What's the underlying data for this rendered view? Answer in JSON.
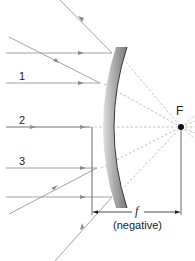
{
  "diagram": {
    "focal_point": {
      "label": "F",
      "x": 180,
      "y": 127
    },
    "ray_labels": [
      {
        "label": "1",
        "x": 22,
        "y": 80
      },
      {
        "label": "2",
        "x": 22,
        "y": 124
      },
      {
        "label": "3",
        "x": 22,
        "y": 166
      }
    ],
    "dimension": {
      "symbol": "f",
      "note": "(negative)"
    },
    "colors": {
      "ray": "#9a9a9a",
      "dashed": "#b5b5b5",
      "mirror_light": "#d4d4d4",
      "mirror_dark": "#7c7c7c",
      "mirror_edge": "#333333",
      "dimension_line": "#333333",
      "text": "#222222"
    }
  }
}
